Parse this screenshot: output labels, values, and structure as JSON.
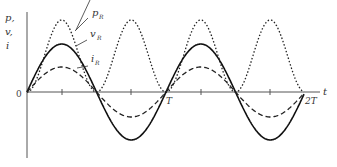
{
  "axis": {
    "y_labels": [
      "p,",
      "v,",
      "i"
    ],
    "origin_label": "0",
    "x_label": "t",
    "ticks": [
      "T",
      "2T"
    ]
  },
  "curves": [
    {
      "name": "p_R",
      "label_main": "p",
      "label_sub": "R",
      "style": "dotted",
      "amplitude": 72
    },
    {
      "name": "v_R",
      "label_main": "v",
      "label_sub": "R",
      "style": "solid",
      "amplitude": 48
    },
    {
      "name": "i_R",
      "label_main": "i",
      "label_sub": "R",
      "style": "dashed",
      "amplitude": 25
    }
  ]
}
